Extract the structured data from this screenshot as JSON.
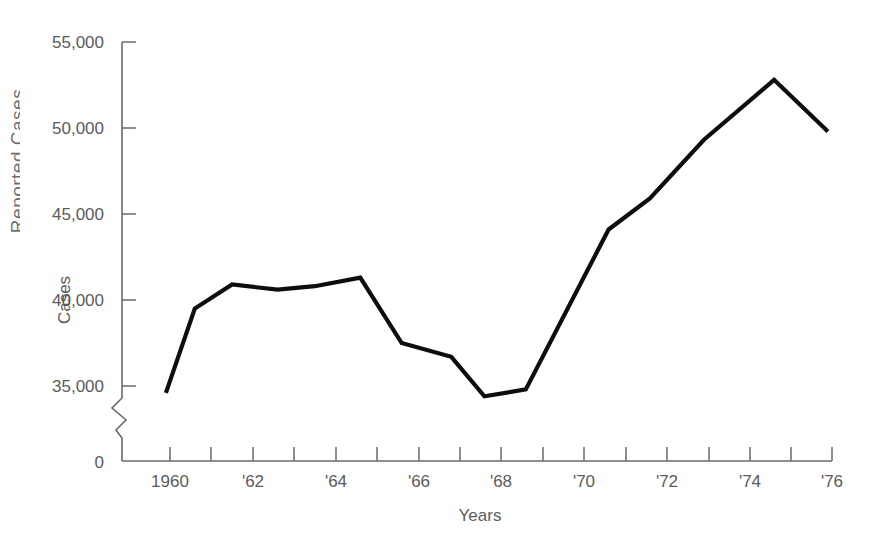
{
  "figure": {
    "clipped_side_text": "Reported Cases"
  },
  "chart_data": {
    "type": "line",
    "title": "",
    "xlabel": "Years",
    "ylabel": "Cases",
    "grid": false,
    "legend": null,
    "axis_break": true,
    "axis_break_note": "zigzag break on y-axis between 0 and 35,000",
    "y_origin_label": "0",
    "xlim": [
      1959,
      1976
    ],
    "ylim": [
      35000,
      55000
    ],
    "yticks": [
      35000,
      40000,
      45000,
      50000,
      55000
    ],
    "ytick_labels": [
      "35,000",
      "40,000",
      "45,000",
      "50,000",
      "55,000"
    ],
    "xticks": [
      1960,
      1961,
      1962,
      1963,
      1964,
      1965,
      1966,
      1967,
      1968,
      1969,
      1970,
      1971,
      1972,
      1973,
      1974,
      1975,
      1976
    ],
    "xtick_labels": [
      "1960",
      "",
      "'62",
      "",
      "'64",
      "",
      "'66",
      "",
      "'68",
      "",
      "'70",
      "",
      "'72",
      "",
      "'74",
      "",
      "'76"
    ],
    "xtick_labels_shown": [
      "1960",
      "'62",
      "'64",
      "'66",
      "'68",
      "'70",
      "'72",
      "'74",
      "'76"
    ],
    "x": [
      1959.9,
      1960.6,
      1961.5,
      1962.6,
      1963.5,
      1964.6,
      1965.6,
      1966.8,
      1967.6,
      1968.6,
      1970.6,
      1971.6,
      1972.9,
      1974.6,
      1975.9
    ],
    "values": [
      34600,
      39500,
      40900,
      40600,
      40800,
      41300,
      37500,
      36700,
      34400,
      34800,
      44100,
      45900,
      49300,
      52800,
      49800
    ],
    "series": [
      {
        "name": "Cases",
        "color": "#0d0d0d",
        "points": [
          {
            "x": 1959.9,
            "y": 34600
          },
          {
            "x": 1960.6,
            "y": 39500
          },
          {
            "x": 1961.5,
            "y": 40900
          },
          {
            "x": 1962.6,
            "y": 40600
          },
          {
            "x": 1963.5,
            "y": 40800
          },
          {
            "x": 1964.6,
            "y": 41300
          },
          {
            "x": 1965.6,
            "y": 37500
          },
          {
            "x": 1966.8,
            "y": 36700
          },
          {
            "x": 1967.6,
            "y": 34400
          },
          {
            "x": 1968.6,
            "y": 34800
          },
          {
            "x": 1970.6,
            "y": 44100
          },
          {
            "x": 1971.6,
            "y": 45900
          },
          {
            "x": 1972.9,
            "y": 49300
          },
          {
            "x": 1974.6,
            "y": 52800
          },
          {
            "x": 1975.9,
            "y": 49800
          }
        ]
      }
    ]
  },
  "axis_labels": {
    "y_55000": "55,000",
    "y_50000": "50,000",
    "y_45000": "45,000",
    "y_40000": "40,000",
    "y_35000": "35,000",
    "y_zero": "0",
    "x_1960": "1960",
    "x_62": "'62",
    "x_64": "'64",
    "x_66": "'66",
    "x_68": "'68",
    "x_70": "'70",
    "x_72": "'72",
    "x_74": "'74",
    "x_76": "'76",
    "y_axis_title": "Cases",
    "x_axis_title": "Years"
  },
  "colors": {
    "line": "#0d0d0d",
    "axis": "#6a6a6a",
    "text": "#5b5b5b",
    "background": "#ffffff"
  }
}
